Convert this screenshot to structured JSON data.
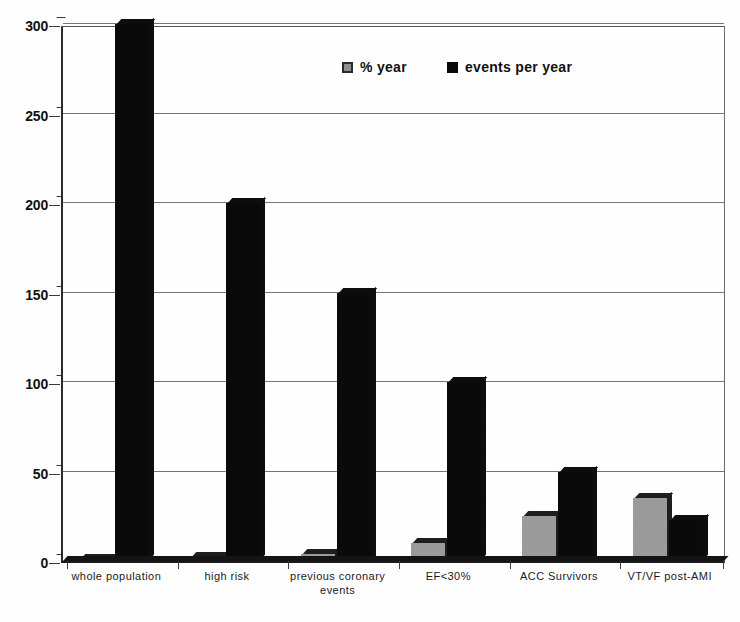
{
  "chart_data": {
    "type": "bar",
    "title": "",
    "subtitle": "",
    "xlabel": "",
    "ylabel": "",
    "ylim": [
      0,
      300
    ],
    "yticks": [
      0,
      50,
      100,
      150,
      200,
      250,
      300
    ],
    "ytick_labels": [
      "0",
      "50",
      "100",
      "150",
      "200",
      "250",
      "300"
    ],
    "grid": true,
    "legend_position": "top-center",
    "categories": [
      "whole population",
      "high risk",
      "previous coronary\nevents",
      "EF<30%",
      "ACC Survivors",
      "VT/VF post-AMI"
    ],
    "series": [
      {
        "name": "% year",
        "color": "#9b9b9b",
        "values": [
          0.5,
          2,
          4,
          10,
          25,
          35
        ]
      },
      {
        "name": "events per year",
        "color": "#0a0a0a",
        "values": [
          300,
          200,
          150,
          100,
          50,
          23
        ]
      }
    ]
  },
  "legend": {
    "entries": [
      {
        "label": "% year",
        "swatch": "gray"
      },
      {
        "label": "events per year",
        "swatch": "black"
      }
    ]
  },
  "axes": {
    "y": {
      "ticks": [
        "300",
        "250",
        "200",
        "150",
        "100",
        "50",
        "0"
      ]
    },
    "x": {
      "labels": [
        "whole population",
        "high risk",
        "previous coronary\nevents",
        "EF<30%",
        "ACC Survivors",
        "VT/VF post-AMI"
      ]
    }
  },
  "colors": {
    "series_gray": "#9b9b9b",
    "series_black": "#0a0a0a",
    "grid": "#767676",
    "axis": "#2b2b2b",
    "background": "#ffffff"
  }
}
